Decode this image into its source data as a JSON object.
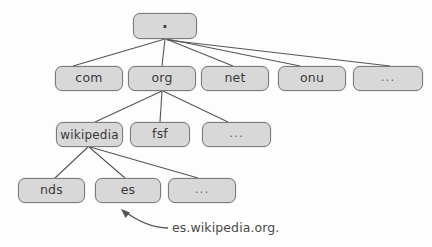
{
  "diagram": {
    "background_color": "#fdfdfd",
    "node_fill_color": "#d8d8d8",
    "node_border_color": "#7a7a7a",
    "edge_color": "#555555",
    "text_color": "#3a3a3a"
  },
  "nodes": {
    "root": {
      "label": ".",
      "x": 133,
      "y": 13,
      "w": 64,
      "h": 26
    },
    "level1": [
      {
        "label": "com",
        "x": 55,
        "y": 66,
        "w": 68,
        "h": 25
      },
      {
        "label": "org",
        "x": 128,
        "y": 66,
        "w": 68,
        "h": 25
      },
      {
        "label": "net",
        "x": 201,
        "y": 66,
        "w": 68,
        "h": 25
      },
      {
        "label": "onu",
        "x": 278,
        "y": 66,
        "w": 68,
        "h": 25
      },
      {
        "label": "...",
        "x": 353,
        "y": 66,
        "w": 70,
        "h": 25
      }
    ],
    "level2": [
      {
        "label": "wikipedia",
        "x": 56,
        "y": 122,
        "w": 67,
        "h": 25
      },
      {
        "label": "fsf",
        "x": 130,
        "y": 122,
        "w": 60,
        "h": 25
      },
      {
        "label": "...",
        "x": 202,
        "y": 122,
        "w": 69,
        "h": 25
      }
    ],
    "level3": [
      {
        "label": "nds",
        "x": 18,
        "y": 178,
        "w": 67,
        "h": 25
      },
      {
        "label": "es",
        "x": 95,
        "y": 178,
        "w": 66,
        "h": 25
      },
      {
        "label": "...",
        "x": 168,
        "y": 178,
        "w": 68,
        "h": 25
      }
    ]
  },
  "edges": [
    {
      "from": "root",
      "to": "com",
      "x1": 165,
      "y1": 39,
      "x2": 73,
      "y2": 66
    },
    {
      "from": "root",
      "to": "org",
      "x1": 165,
      "y1": 39,
      "x2": 162,
      "y2": 66
    },
    {
      "from": "root",
      "to": "net",
      "x1": 166,
      "y1": 39,
      "x2": 233,
      "y2": 66
    },
    {
      "from": "root",
      "to": "onu",
      "x1": 167,
      "y1": 39,
      "x2": 300,
      "y2": 66
    },
    {
      "from": "root",
      "to": "dots1",
      "x1": 167,
      "y1": 40,
      "x2": 390,
      "y2": 66
    },
    {
      "from": "org",
      "to": "wikipedia",
      "x1": 162,
      "y1": 91,
      "x2": 95,
      "y2": 122
    },
    {
      "from": "org",
      "to": "fsf",
      "x1": 162,
      "y1": 91,
      "x2": 160,
      "y2": 122
    },
    {
      "from": "org",
      "to": "dots2",
      "x1": 163,
      "y1": 91,
      "x2": 228,
      "y2": 122
    },
    {
      "from": "wikipedia",
      "to": "nds",
      "x1": 88,
      "y1": 147,
      "x2": 55,
      "y2": 178
    },
    {
      "from": "wikipedia",
      "to": "es",
      "x1": 89,
      "y1": 147,
      "x2": 125,
      "y2": 178
    },
    {
      "from": "wikipedia",
      "to": "dots3",
      "x1": 90,
      "y1": 147,
      "x2": 198,
      "y2": 178
    }
  ],
  "annotation": {
    "label": "es.wikipedia.org.",
    "x": 172,
    "y": 220,
    "arrow": {
      "path": "M 168 228 C 152 228, 139 222, 124 211",
      "head_x": 121,
      "head_y": 209,
      "points_to": "es"
    }
  }
}
